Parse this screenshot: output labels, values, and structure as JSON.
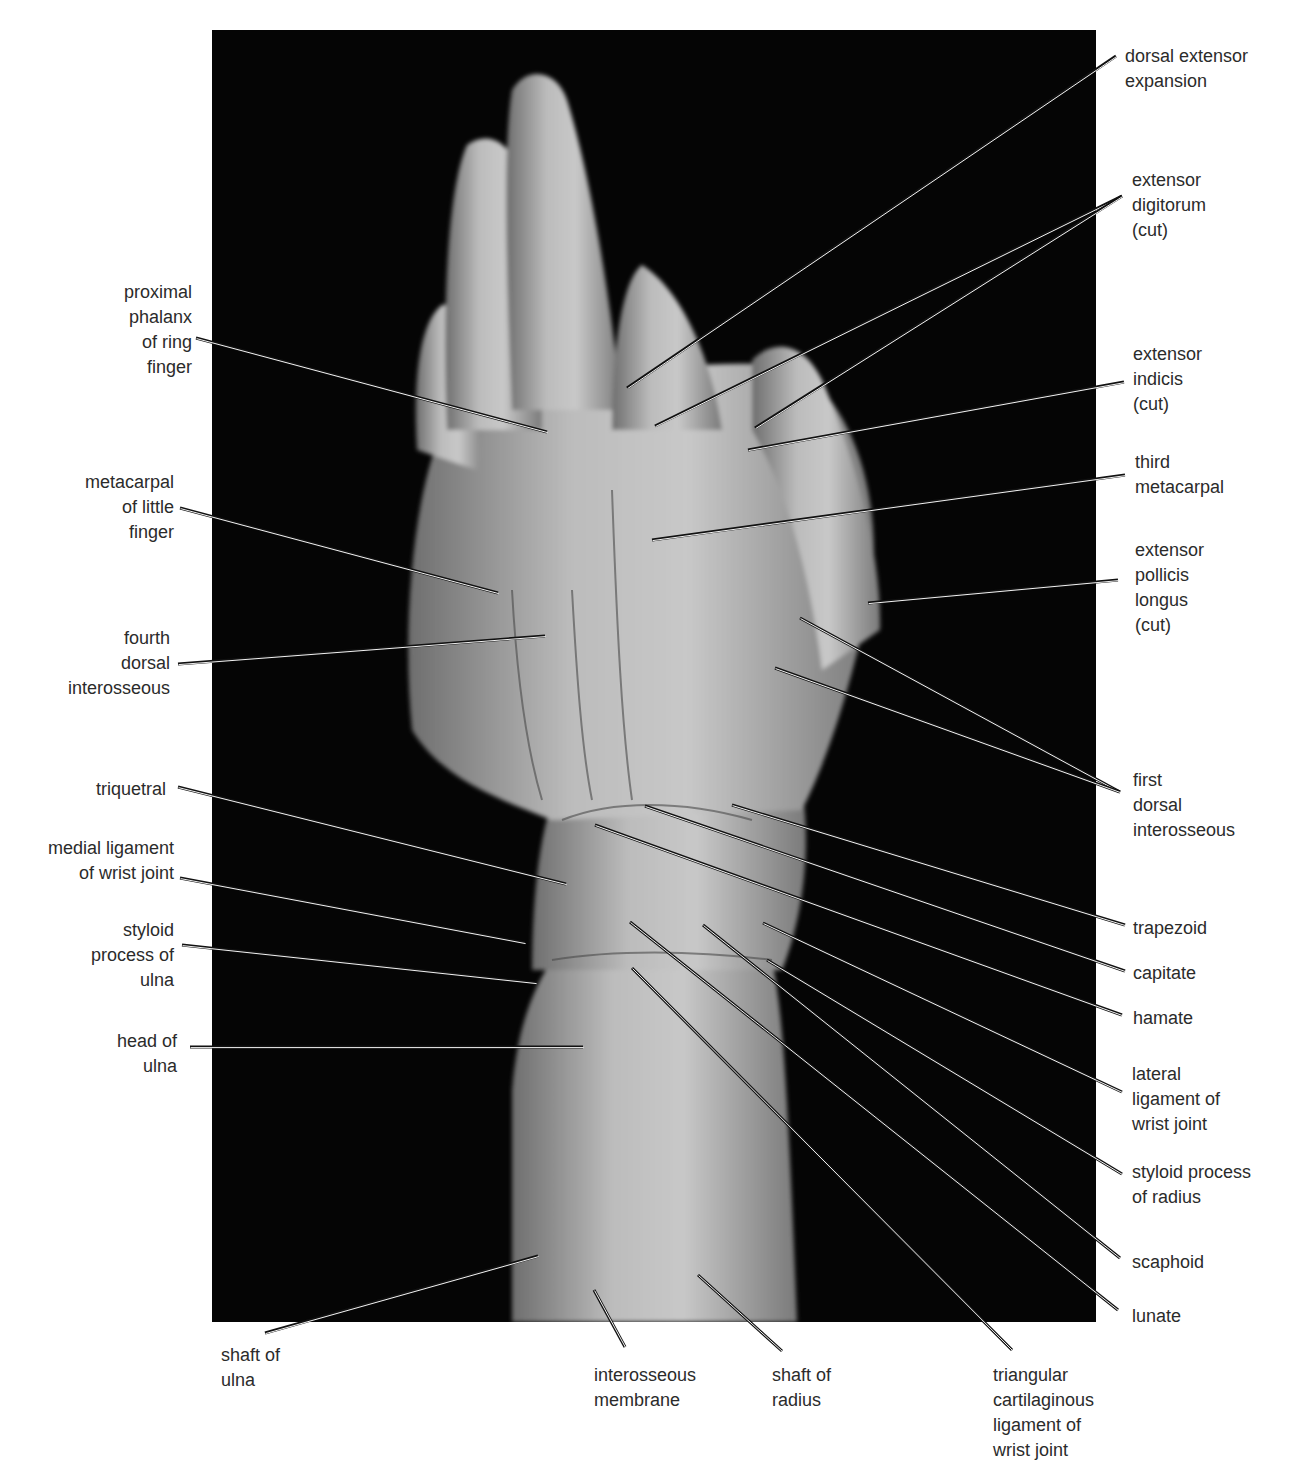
{
  "figure": {
    "photo_background": "#050505",
    "tissue_color": "#bdbdbd",
    "leader_color_outer": "#111111",
    "leader_color_inner": "#f2f2f2"
  },
  "labels": [
    {
      "id": "dorsal-extensor-expansion",
      "text": "dorsal extensor\nexpansion",
      "side": "right",
      "x": 1125,
      "y": 44,
      "lines": [
        [
          1116,
          56,
          627,
          388
        ]
      ]
    },
    {
      "id": "extensor-digitorum-cut",
      "text": "extensor\ndigitorum\n(cut)",
      "side": "right",
      "x": 1132,
      "y": 168,
      "lines": [
        [
          1122,
          196,
          655,
          426
        ],
        [
          1122,
          196,
          755,
          428
        ]
      ]
    },
    {
      "id": "extensor-indicis-cut",
      "text": "extensor\nindicis\n(cut)",
      "side": "right",
      "x": 1133,
      "y": 342,
      "lines": [
        [
          1124,
          382,
          748,
          450
        ]
      ]
    },
    {
      "id": "third-metacarpal",
      "text": "third\nmetacarpal",
      "side": "right",
      "x": 1135,
      "y": 450,
      "lines": [
        [
          1125,
          475,
          652,
          540
        ]
      ]
    },
    {
      "id": "extensor-pollicis-longus-cut",
      "text": "extensor\npollicis\nlongus\n(cut)",
      "side": "right",
      "x": 1135,
      "y": 538,
      "lines": [
        [
          1118,
          580,
          868,
          603
        ]
      ]
    },
    {
      "id": "first-dorsal-interosseous",
      "text": "first\ndorsal\ninterosseous",
      "side": "right",
      "x": 1133,
      "y": 768,
      "lines": [
        [
          1120,
          792,
          800,
          618
        ],
        [
          1120,
          792,
          775,
          668
        ]
      ]
    },
    {
      "id": "trapezoid",
      "text": "trapezoid",
      "side": "right",
      "x": 1133,
      "y": 916,
      "lines": [
        [
          1125,
          925,
          732,
          805
        ]
      ]
    },
    {
      "id": "capitate",
      "text": "capitate",
      "side": "right",
      "x": 1133,
      "y": 961,
      "lines": [
        [
          1125,
          971,
          645,
          806
        ]
      ]
    },
    {
      "id": "hamate",
      "text": "hamate",
      "side": "right",
      "x": 1133,
      "y": 1006,
      "lines": [
        [
          1122,
          1015,
          595,
          825
        ]
      ]
    },
    {
      "id": "lateral-ligament-of-wrist-joint",
      "text": "lateral\nligament of\nwrist joint",
      "side": "right",
      "x": 1132,
      "y": 1062,
      "lines": [
        [
          1122,
          1092,
          763,
          923
        ]
      ]
    },
    {
      "id": "styloid-process-of-radius",
      "text": "styloid process\nof radius",
      "side": "right",
      "x": 1132,
      "y": 1160,
      "lines": [
        [
          1122,
          1174,
          767,
          960
        ]
      ]
    },
    {
      "id": "scaphoid",
      "text": "scaphoid",
      "side": "right",
      "x": 1132,
      "y": 1250,
      "lines": [
        [
          1120,
          1258,
          703,
          925
        ]
      ]
    },
    {
      "id": "lunate",
      "text": "lunate",
      "side": "right",
      "x": 1132,
      "y": 1304,
      "lines": [
        [
          1118,
          1310,
          630,
          922
        ]
      ]
    },
    {
      "id": "proximal-phalanx-of-ring-finger",
      "text": "proximal\nphalanx\nof ring\nfinger",
      "side": "left",
      "x": 40,
      "y": 280,
      "w": 152,
      "lines": [
        [
          196,
          338,
          547,
          432
        ]
      ]
    },
    {
      "id": "metacarpal-of-little-finger",
      "text": "metacarpal\nof little\nfinger",
      "side": "left",
      "x": 40,
      "y": 470,
      "w": 134,
      "lines": [
        [
          180,
          508,
          498,
          593
        ]
      ]
    },
    {
      "id": "fourth-dorsal-interosseous",
      "text": "fourth\ndorsal\ninterosseous",
      "side": "left",
      "x": 40,
      "y": 626,
      "w": 130,
      "lines": [
        [
          178,
          664,
          545,
          636
        ]
      ]
    },
    {
      "id": "triquetral",
      "text": "triquetral",
      "side": "left",
      "x": 40,
      "y": 777,
      "w": 126,
      "lines": [
        [
          178,
          787,
          566,
          884
        ]
      ]
    },
    {
      "id": "medial-ligament-of-wrist-joint",
      "text": "medial ligament\nof wrist joint",
      "side": "left",
      "x": 20,
      "y": 836,
      "w": 154,
      "lines": [
        [
          180,
          878,
          525,
          943
        ]
      ]
    },
    {
      "id": "styloid-process-of-ulna",
      "text": "styloid\nprocess of\nulna",
      "side": "left",
      "x": 40,
      "y": 918,
      "w": 134,
      "lines": [
        [
          182,
          945,
          536,
          983
        ]
      ]
    },
    {
      "id": "head-of-ulna",
      "text": "head of\nulna",
      "side": "left",
      "x": 40,
      "y": 1029,
      "w": 137,
      "lines": [
        [
          190,
          1047,
          583,
          1047
        ]
      ]
    },
    {
      "id": "shaft-of-ulna",
      "text": "shaft of\nulna",
      "side": "bottom",
      "x": 221,
      "y": 1343,
      "lines": [
        [
          265,
          1333,
          538,
          1256
        ]
      ]
    },
    {
      "id": "interosseous-membrane",
      "text": "interosseous\nmembrane",
      "side": "bottom",
      "x": 594,
      "y": 1363,
      "lines": [
        [
          625,
          1347,
          594,
          1290
        ]
      ]
    },
    {
      "id": "shaft-of-radius",
      "text": "shaft of\nradius",
      "side": "bottom",
      "x": 772,
      "y": 1363,
      "lines": [
        [
          782,
          1351,
          698,
          1275
        ]
      ]
    },
    {
      "id": "triangular-cartilaginous-ligament-of-wrist-joint",
      "text": "triangular\ncartilaginous\nligament of\nwrist joint",
      "side": "bottom",
      "x": 993,
      "y": 1363,
      "lines": [
        [
          1012,
          1350,
          632,
          968
        ]
      ]
    }
  ]
}
